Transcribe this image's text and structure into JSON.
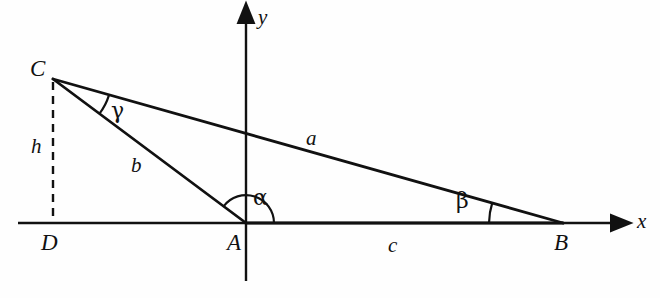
{
  "figure": {
    "background_color": "#fefefe",
    "stroke_color": "#111111"
  },
  "axes": {
    "x_label": "x",
    "y_label": "y",
    "x_axis": {
      "x1": 18,
      "y1": 223,
      "x2": 628,
      "y2": 223
    },
    "y_axis": {
      "x1": 246,
      "y1": 12,
      "x2": 246,
      "y2": 281
    }
  },
  "vertices": [
    {
      "name": "C",
      "label": "C",
      "x": 53,
      "y": 79,
      "label_x": 30,
      "label_y": 57
    },
    {
      "name": "A",
      "label": "A",
      "x": 246,
      "y": 223,
      "label_x": 227,
      "label_y": 231
    },
    {
      "name": "B",
      "label": "B",
      "x": 563,
      "y": 223,
      "label_x": 554,
      "label_y": 231
    },
    {
      "name": "D",
      "label": "D",
      "x": 53,
      "y": 223,
      "label_x": 41,
      "label_y": 231
    }
  ],
  "sides": [
    {
      "name": "a",
      "label": "a",
      "from": "C",
      "to": "B",
      "label_x": 306,
      "label_y": 128
    },
    {
      "name": "b",
      "label": "b",
      "from": "C",
      "to": "A",
      "label_x": 131,
      "label_y": 155
    },
    {
      "name": "c",
      "label": "c",
      "from": "A",
      "to": "B",
      "label_x": 388,
      "label_y": 235
    },
    {
      "name": "h",
      "label": "h",
      "from": "C",
      "to": "D",
      "label_x": 31,
      "label_y": 136,
      "style": "dashed"
    }
  ],
  "angles": [
    {
      "name": "alpha",
      "label": "α",
      "at_vertex": "A",
      "label_x": 253,
      "label_y": 187,
      "radius": 28
    },
    {
      "name": "beta",
      "label": "β",
      "at_vertex": "B",
      "label_x": 456,
      "label_y": 190,
      "radius": 74
    },
    {
      "name": "gamma",
      "label": "γ",
      "at_vertex": "C",
      "label_x": 111,
      "label_y": 100,
      "radius": 58
    }
  ]
}
